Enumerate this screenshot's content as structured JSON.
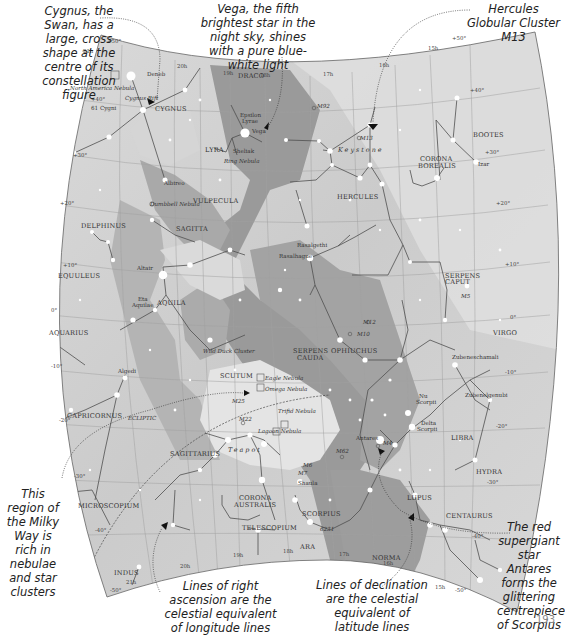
{
  "page": {
    "number": "193"
  },
  "colors": {
    "sky_light": "#e6e6e6",
    "sky_mid": "#cfcfcf",
    "milky_way_dark": "#8f8f8f",
    "milky_way_mid": "#b2b2b2",
    "grid": "#a6a6a6",
    "constellation_line": "#5a5a5a",
    "star": "#ffffff",
    "border": "#666666"
  },
  "callouts": [
    {
      "id": "cygnus",
      "text": "Cygnus, the Swan, has a large, cross shape at the centre of its constellation figure"
    },
    {
      "id": "vega",
      "text": "Vega, the fifth brightest star in the night sky, shines with a pure blue-white light"
    },
    {
      "id": "m13",
      "text": "Hercules Globular Cluster M13"
    },
    {
      "id": "milkyway",
      "text": "This region of the Milky Way is rich in nebulae and star clusters"
    },
    {
      "id": "ra",
      "text": "Lines of right ascension are the celestial equivalent of longitude lines"
    },
    {
      "id": "dec",
      "text": "Lines of declination are the celestial equivalent of latitude lines"
    },
    {
      "id": "antares",
      "text": "The red supergiant star Antares forms the glittering centrepiece of Scorpius"
    }
  ],
  "constellations": [
    {
      "name": "CYGNUS",
      "x": 155,
      "y": 111
    },
    {
      "name": "DRACO",
      "x": 238,
      "y": 78
    },
    {
      "name": "LYRA",
      "x": 205,
      "y": 152
    },
    {
      "name": "VULPECULA",
      "x": 193,
      "y": 203
    },
    {
      "name": "SAGITTA",
      "x": 176,
      "y": 231
    },
    {
      "name": "DELPHINUS",
      "x": 81,
      "y": 228
    },
    {
      "name": "EQUULEUS",
      "x": 58,
      "y": 278
    },
    {
      "name": "AQUILA",
      "x": 157,
      "y": 305
    },
    {
      "name": "AQUARIUS",
      "x": 49,
      "y": 335
    },
    {
      "name": "SCUTUM",
      "x": 220,
      "y": 378
    },
    {
      "name": "CAPRICORNUS",
      "x": 67,
      "y": 418
    },
    {
      "name": "SAGITTARIUS",
      "x": 170,
      "y": 456
    },
    {
      "name": "MICROSCOPIUM",
      "x": 78,
      "y": 508
    },
    {
      "name": "CORONA",
      "x": 239,
      "y": 500
    },
    {
      "name": "AUSTRALIS",
      "x": 234,
      "y": 507
    },
    {
      "name": "TELESCOPIUM",
      "x": 242,
      "y": 530
    },
    {
      "name": "INDUS",
      "x": 114,
      "y": 575
    },
    {
      "name": "ARA",
      "x": 300,
      "y": 549
    },
    {
      "name": "SCORPIUS",
      "x": 302,
      "y": 516
    },
    {
      "name": "NORMA",
      "x": 372,
      "y": 560
    },
    {
      "name": "LUPUS",
      "x": 407,
      "y": 500
    },
    {
      "name": "CENTAURUS",
      "x": 446,
      "y": 518
    },
    {
      "name": "HYDRA",
      "x": 476,
      "y": 474
    },
    {
      "name": "LIBRA",
      "x": 451,
      "y": 440
    },
    {
      "name": "VIRGO",
      "x": 493,
      "y": 335
    },
    {
      "name": "OPHIUCHUS",
      "x": 331,
      "y": 353
    },
    {
      "name": "SERPENS",
      "x": 293,
      "y": 353
    },
    {
      "name": "CAUDA",
      "x": 297,
      "y": 360
    },
    {
      "name": "SERPENS",
      "x": 445,
      "y": 278
    },
    {
      "name": "CAPUT",
      "x": 445,
      "y": 284
    },
    {
      "name": "HERCULES",
      "x": 337,
      "y": 199
    },
    {
      "name": "CORONA",
      "x": 420,
      "y": 161
    },
    {
      "name": "BOREALIS",
      "x": 418,
      "y": 168
    },
    {
      "name": "BOOTES",
      "x": 473,
      "y": 137
    }
  ],
  "stars_named": [
    {
      "name": "Deneb",
      "x": 147,
      "y": 76
    },
    {
      "name": "61 Cygni",
      "x": 91,
      "y": 110
    },
    {
      "name": "Epsilon",
      "x": 240,
      "y": 117
    },
    {
      "name": "Lyrae",
      "x": 242,
      "y": 123
    },
    {
      "name": "Vega",
      "x": 252,
      "y": 133
    },
    {
      "name": "Sheliak",
      "x": 233,
      "y": 153
    },
    {
      "name": "Albireo",
      "x": 164,
      "y": 185
    },
    {
      "name": "Rasalgethi",
      "x": 297,
      "y": 247
    },
    {
      "name": "Rasalhague",
      "x": 279,
      "y": 258
    },
    {
      "name": "Altair",
      "x": 137,
      "y": 270
    },
    {
      "name": "Eta",
      "x": 138,
      "y": 301
    },
    {
      "name": "Aquilae",
      "x": 132,
      "y": 307
    },
    {
      "name": "Algedi",
      "x": 118,
      "y": 373
    },
    {
      "name": "Zubeneschamali",
      "x": 452,
      "y": 359
    },
    {
      "name": "Zubenelgenubi",
      "x": 465,
      "y": 397
    },
    {
      "name": "Nu",
      "x": 419,
      "y": 398
    },
    {
      "name": "Scorpii",
      "x": 416,
      "y": 404
    },
    {
      "name": "Delta",
      "x": 421,
      "y": 425
    },
    {
      "name": "Scorpii",
      "x": 417,
      "y": 431
    },
    {
      "name": "Antares",
      "x": 356,
      "y": 440
    },
    {
      "name": "Shaula",
      "x": 298,
      "y": 485
    },
    {
      "name": "Izar",
      "x": 478,
      "y": 166
    }
  ],
  "deep_sky": [
    {
      "name": "North America Nebula",
      "x": 70,
      "y": 90
    },
    {
      "name": "Ring Nebula",
      "x": 224,
      "y": 163
    },
    {
      "name": "Dumbbell Nebula",
      "x": 150,
      "y": 206
    },
    {
      "name": "Wild Duck Cluster",
      "x": 203,
      "y": 353
    },
    {
      "name": "Eagle Nebula",
      "x": 265,
      "y": 380
    },
    {
      "name": "Omega Nebula",
      "x": 265,
      "y": 391
    },
    {
      "name": "M25",
      "x": 232,
      "y": 403
    },
    {
      "name": "M22",
      "x": 239,
      "y": 421
    },
    {
      "name": "Trifid Nebula",
      "x": 278,
      "y": 413
    },
    {
      "name": "Lagoon Nebula",
      "x": 258,
      "y": 433
    },
    {
      "name": "M92",
      "x": 317,
      "y": 108
    },
    {
      "name": "M13",
      "x": 360,
      "y": 140
    },
    {
      "name": "M12",
      "x": 363,
      "y": 324
    },
    {
      "name": "M10",
      "x": 357,
      "y": 336
    },
    {
      "name": "M5",
      "x": 461,
      "y": 298
    },
    {
      "name": "M4",
      "x": 383,
      "y": 445
    },
    {
      "name": "M62",
      "x": 336,
      "y": 453
    },
    {
      "name": "M6",
      "x": 303,
      "y": 467
    },
    {
      "name": "M7",
      "x": 298,
      "y": 475
    },
    {
      "name": "6231",
      "x": 320,
      "y": 531
    }
  ],
  "asterisms": [
    {
      "name": "Keystone",
      "x": 338,
      "y": 152
    },
    {
      "name": "Teapot",
      "x": 228,
      "y": 452
    }
  ],
  "labels_misc": [
    {
      "name": "Cygnus Rift",
      "x": 125,
      "y": 100
    },
    {
      "name": "ECLIPTIC",
      "x": 128,
      "y": 420
    }
  ],
  "grid_labels": {
    "ra": [
      {
        "text": "21h",
        "x": 83,
        "y": 53
      },
      {
        "text": "20h",
        "x": 177,
        "y": 68
      },
      {
        "text": "19h",
        "x": 223,
        "y": 75
      },
      {
        "text": "18h",
        "x": 260,
        "y": 77
      },
      {
        "text": "17h",
        "x": 323,
        "y": 76
      },
      {
        "text": "16h",
        "x": 379,
        "y": 67
      },
      {
        "text": "15h",
        "x": 428,
        "y": 50
      },
      {
        "text": "20h",
        "x": 180,
        "y": 568
      },
      {
        "text": "19h",
        "x": 233,
        "y": 557
      },
      {
        "text": "18h",
        "x": 283,
        "y": 553
      },
      {
        "text": "17h",
        "x": 339,
        "y": 556
      },
      {
        "text": "16h",
        "x": 383,
        "y": 565
      },
      {
        "text": "15h",
        "x": 435,
        "y": 589
      },
      {
        "text": "21h",
        "x": 126,
        "y": 584
      }
    ],
    "dec": [
      {
        "text": "+50°",
        "x": 107,
        "y": 43
      },
      {
        "text": "+40°",
        "x": 91,
        "y": 101
      },
      {
        "text": "+30°",
        "x": 73,
        "y": 157
      },
      {
        "text": "+20°",
        "x": 60,
        "y": 205
      },
      {
        "text": "+10°",
        "x": 63,
        "y": 267
      },
      {
        "text": "0°",
        "x": 51,
        "y": 312
      },
      {
        "text": "-10°",
        "x": 51,
        "y": 368
      },
      {
        "text": "-20°",
        "x": 59,
        "y": 422
      },
      {
        "text": "-30°",
        "x": 74,
        "y": 478
      },
      {
        "text": "-40°",
        "x": 95,
        "y": 532
      },
      {
        "text": "-50°",
        "x": 110,
        "y": 592
      },
      {
        "text": "+50°",
        "x": 452,
        "y": 40
      },
      {
        "text": "+40°",
        "x": 470,
        "y": 92
      },
      {
        "text": "+30°",
        "x": 485,
        "y": 154
      },
      {
        "text": "+20°",
        "x": 496,
        "y": 205
      },
      {
        "text": "+10°",
        "x": 505,
        "y": 266
      },
      {
        "text": "0°",
        "x": 510,
        "y": 319
      },
      {
        "text": "-10°",
        "x": 505,
        "y": 374
      },
      {
        "text": "-20°",
        "x": 496,
        "y": 428
      },
      {
        "text": "-30°",
        "x": 487,
        "y": 484
      },
      {
        "text": "-40°",
        "x": 472,
        "y": 538
      },
      {
        "text": "-50°",
        "x": 455,
        "y": 592
      }
    ]
  }
}
